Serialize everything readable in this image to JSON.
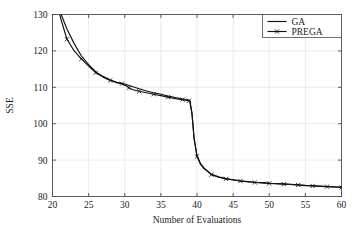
{
  "chart_data": {
    "type": "line",
    "title": "",
    "xlabel": "Number of Evaluations",
    "ylabel": "SSE",
    "xlim": [
      20,
      60
    ],
    "ylim": [
      80,
      130
    ],
    "xticks": [
      20,
      25,
      30,
      35,
      40,
      45,
      50,
      55,
      60
    ],
    "yticks": [
      80,
      90,
      100,
      110,
      120,
      130
    ],
    "xtick_labels": [
      "20",
      "25",
      "30",
      "35",
      "40",
      "45",
      "50",
      "55",
      "60"
    ],
    "ytick_labels": [
      "80",
      "90",
      "100",
      "110",
      "120",
      "130"
    ],
    "grid": true,
    "legend_position": "upper right",
    "series": [
      {
        "name": "GA",
        "color": "#111111",
        "marker": "none",
        "linestyle": "solid",
        "x": [
          20.0,
          20.6,
          21.2,
          22.0,
          23.0,
          24.0,
          25.0,
          26.0,
          27.0,
          28.0,
          29.0,
          30.0,
          31.0,
          32.0,
          33.0,
          34.0,
          35.0,
          36.0,
          37.0,
          38.0,
          38.8,
          39.0,
          39.3,
          39.6,
          40.0,
          40.5,
          41.0,
          42.0,
          43.0,
          44.0,
          45.0,
          46.0,
          47.0,
          48.0,
          49.0,
          50.0,
          51.0,
          52.0,
          53.0,
          54.0,
          55.0,
          56.0,
          57.0,
          58.0,
          59.0,
          60.0
        ],
        "y": [
          136.0,
          133.0,
          130.0,
          126.0,
          122.0,
          118.6,
          116.2,
          114.2,
          113.0,
          112.0,
          111.3,
          110.9,
          110.2,
          109.6,
          109.0,
          108.5,
          108.1,
          107.6,
          107.2,
          106.8,
          106.5,
          106.4,
          103.0,
          96.0,
          91.2,
          89.0,
          87.8,
          86.1,
          85.4,
          84.9,
          84.6,
          84.3,
          84.1,
          83.9,
          83.8,
          83.65,
          83.55,
          83.45,
          83.35,
          83.2,
          83.05,
          82.95,
          82.85,
          82.75,
          82.65,
          82.55
        ]
      },
      {
        "name": "PREGA",
        "color": "#111111",
        "marker": "x",
        "linestyle": "solid",
        "x": [
          20.0,
          20.6,
          21.2,
          22.0,
          23.0,
          24.0,
          25.0,
          26.0,
          27.0,
          28.0,
          29.0,
          29.6,
          30.0,
          30.6,
          31.0,
          32.0,
          33.0,
          34.0,
          35.0,
          36.0,
          37.0,
          38.0,
          38.8,
          39.0,
          39.3,
          39.6,
          40.0,
          40.5,
          41.0,
          42.0,
          43.0,
          44.0,
          45.0,
          46.0,
          47.0,
          48.0,
          49.0,
          50.0,
          51.0,
          52.0,
          53.0,
          54.0,
          55.0,
          56.0,
          57.0,
          58.0,
          59.0,
          60.0
        ],
        "y": [
          137.0,
          133.0,
          128.5,
          123.2,
          120.0,
          117.8,
          115.8,
          114.0,
          112.8,
          111.9,
          111.2,
          111.0,
          110.6,
          109.9,
          109.4,
          108.9,
          108.5,
          108.1,
          107.7,
          107.3,
          106.9,
          106.6,
          106.3,
          106.2,
          102.8,
          95.8,
          91.0,
          88.8,
          87.6,
          86.0,
          85.3,
          84.85,
          84.55,
          84.25,
          84.05,
          83.85,
          83.75,
          83.6,
          83.5,
          83.4,
          83.3,
          83.15,
          83.0,
          82.9,
          82.8,
          82.7,
          82.6,
          82.5
        ]
      }
    ],
    "markers_prega": [
      {
        "x": 22.0,
        "y": 123.2
      },
      {
        "x": 24.0,
        "y": 117.8
      },
      {
        "x": 26.0,
        "y": 114.0
      },
      {
        "x": 28.0,
        "y": 111.9
      },
      {
        "x": 29.6,
        "y": 111.0
      },
      {
        "x": 30.6,
        "y": 109.9
      },
      {
        "x": 32.0,
        "y": 108.9
      },
      {
        "x": 34.0,
        "y": 108.1
      },
      {
        "x": 36.0,
        "y": 107.3
      },
      {
        "x": 38.0,
        "y": 106.6
      },
      {
        "x": 38.9,
        "y": 106.3
      },
      {
        "x": 40.0,
        "y": 91.0
      },
      {
        "x": 42.0,
        "y": 86.0
      },
      {
        "x": 44.0,
        "y": 84.85
      },
      {
        "x": 46.0,
        "y": 84.25
      },
      {
        "x": 48.0,
        "y": 83.85
      },
      {
        "x": 50.0,
        "y": 83.6
      },
      {
        "x": 52.0,
        "y": 83.4
      },
      {
        "x": 54.0,
        "y": 83.15
      },
      {
        "x": 56.0,
        "y": 82.9
      },
      {
        "x": 58.0,
        "y": 82.7
      },
      {
        "x": 60.0,
        "y": 82.5
      }
    ]
  },
  "legend": {
    "entries": [
      {
        "label": "GA",
        "marker": "none"
      },
      {
        "label": "PREGA",
        "marker": "x"
      }
    ]
  },
  "colors": {
    "line": "#111111",
    "grid": "#e3e3e3",
    "axis": "#4d4d4d",
    "background": "#ffffff"
  }
}
